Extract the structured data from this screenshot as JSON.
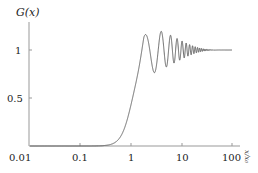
{
  "chart_data": {
    "type": "line",
    "title": "",
    "ylabel": "G(x)",
    "xlabel": "x/x₀",
    "xscale": "log",
    "xlim": [
      0.01,
      100
    ],
    "ylim": [
      0,
      1.3
    ],
    "xticks": [
      {
        "value": 0.01,
        "label": "0.01"
      },
      {
        "value": 0.1,
        "label": "0.1"
      },
      {
        "value": 1,
        "label": "1"
      },
      {
        "value": 10,
        "label": "10"
      },
      {
        "value": 100,
        "label": "100"
      }
    ],
    "yticks": [
      {
        "value": 0.5,
        "label": "0.5"
      },
      {
        "value": 1,
        "label": "1"
      }
    ],
    "grid": false,
    "legend": null,
    "series": [
      {
        "name": "G(x)",
        "color": "#555555",
        "description": "Near zero until x≈0.4, rises steeply through x≈1, overshoots to a peak ≈1.25 at x≈2.2, then damped oscillations converging to 1 by x≈100",
        "x": [
          0.01,
          0.1,
          0.3,
          0.5,
          0.7,
          1.0,
          1.3,
          1.6,
          2.0,
          2.2,
          2.6,
          3.0,
          3.5,
          4.2,
          5.0,
          6.0,
          8.0,
          12,
          20,
          40,
          100
        ],
        "y": [
          0.0,
          0.0,
          0.0,
          0.03,
          0.12,
          0.38,
          0.72,
          1.02,
          1.22,
          1.25,
          1.12,
          0.9,
          0.85,
          1.1,
          0.93,
          1.07,
          0.96,
          1.03,
          0.99,
          1.01,
          1.0
        ]
      }
    ]
  }
}
